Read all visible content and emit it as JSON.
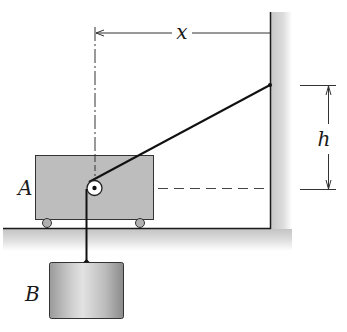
{
  "diagram": {
    "labels": {
      "block_a": "A",
      "block_b": "B",
      "horizontal_distance": "x",
      "vertical_distance": "h"
    },
    "colors": {
      "block_fill": "#bdbdbd",
      "outline": "#1a1a1a",
      "shade": "#cfcfcf",
      "background": "#ffffff"
    }
  }
}
